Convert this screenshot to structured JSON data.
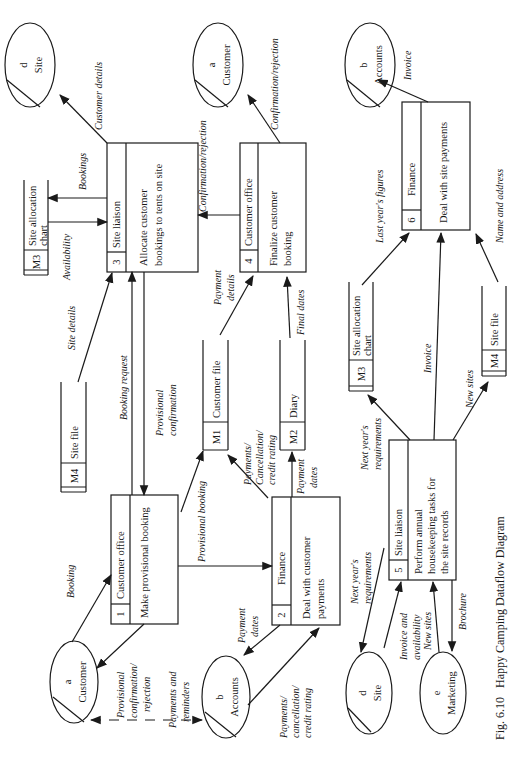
{
  "caption": "Fig. 6.10   Happy Camping Dataflow Diagram",
  "externals": {
    "customer_top": {
      "id": "a",
      "name": "Customer"
    },
    "site_top": {
      "id": "d",
      "name": "Site"
    },
    "accounts_top": {
      "id": "b",
      "name": "Accounts"
    },
    "customer_bottom": {
      "id": "a",
      "name": "Customer"
    },
    "accounts_bottom": {
      "id": "b",
      "name": "Accounts"
    },
    "site_bottom": {
      "id": "d",
      "name": "Site"
    },
    "marketing": {
      "id": "e",
      "name": "Marketing"
    }
  },
  "processes": {
    "p1": {
      "num": "1",
      "actor": "Customer  office",
      "task_l1": "Make provisional booking",
      "task_l2": ""
    },
    "p2": {
      "num": "2",
      "actor": "Finance",
      "task_l1": "Deal with customer",
      "task_l2": "payments"
    },
    "p3": {
      "num": "3",
      "actor": "Site  liaison",
      "task_l1": "Allocate  customer",
      "task_l2": "bookings to tents on site"
    },
    "p4": {
      "num": "4",
      "actor": "Customer  office",
      "task_l1": "Finalize  customer",
      "task_l2": "booking"
    },
    "p5": {
      "num": "5",
      "actor": "Site  liaison",
      "task_l1": "Perform  annual",
      "task_l2": "housekeeping tasks for",
      "task_l3": "the site records"
    },
    "p6": {
      "num": "6",
      "actor": "Finance",
      "task_l1": "Deal with site payments"
    }
  },
  "stores": {
    "m1": {
      "id": "M1",
      "name": "Customer file"
    },
    "m2": {
      "id": "M2",
      "name": "Diary"
    },
    "m3_top": {
      "id": "M3",
      "name_l1": "Site  allocation",
      "name_l2": "chart"
    },
    "m4_top": {
      "id": "M4",
      "name": "Site  file"
    },
    "m3_bottom": {
      "id": "M3",
      "name_l1": "Site  allocation",
      "name_l2": "chart"
    },
    "m4_bottom": {
      "id": "M4",
      "name": "Site  file"
    }
  },
  "flows": {
    "booking": "Booking",
    "prov_conf_rej_l1": "Provisional",
    "prov_conf_rej_l2": "confirmation/",
    "prov_conf_rej_l3": "rejection",
    "payments_reminders_l1": "Payments and",
    "payments_reminders_l2": "reminders",
    "booking_request": "Booking request",
    "prov_confirmation_l1": "Provisional",
    "prov_confirmation_l2": "confirmation",
    "provisional_booking": "Provisional booking",
    "site_details": "Site details",
    "availability": "Availability",
    "bookings": "Bookings",
    "customer_details": "Customer details",
    "confirmation_rejection_1": "Confirmation/rejection",
    "confirmation_rejection_2": "Confirmation/rejection",
    "payment_details_l1": "Payment",
    "payment_details_l2": "details",
    "final_dates": "Final dates",
    "pcc_m1_l1": "Payments/",
    "pcc_m1_l2": "Cancellation/",
    "pcc_m1_l3": "credit rating",
    "payment_dates_m2_l1": "Payment",
    "payment_dates_m2_l2": "dates",
    "payment_dates_acc_l1": "Payment",
    "payment_dates_acc_l2": "dates",
    "pcc_acc_l1": "Payments/",
    "pcc_acc_l2": "cancellation/",
    "pcc_acc_l3": "credit rating",
    "invoice_top": "Invoice",
    "last_years_figures": "Last year's figures",
    "name_and_address": "Name and address",
    "invoice_mid": "Invoice",
    "next_years_req_m3_l1": "Next year's",
    "next_years_req_m3_l2": "requirements",
    "new_sites_m4": "New sites",
    "next_years_req_site_l1": "Next year's",
    "next_years_req_site_l2": "requirements",
    "invoice_avail_l1": "Invoice and",
    "invoice_avail_l2": "availability",
    "new_sites_mkt": "New sites",
    "brochure": "Brochure"
  }
}
